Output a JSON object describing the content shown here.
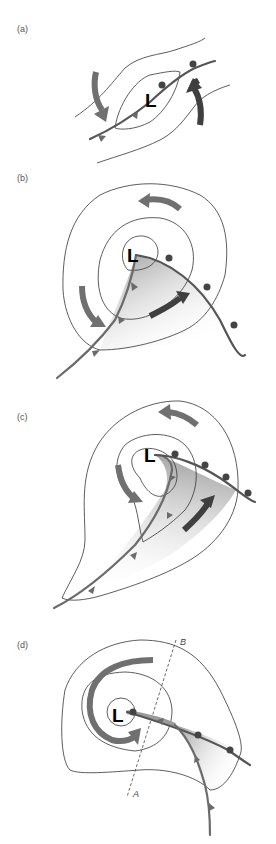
{
  "figure": {
    "panels": [
      {
        "id": "a",
        "label": "(a)",
        "low_symbol": "L",
        "description": "Stationary front with initial wave; isobars and opposing flow arrows"
      },
      {
        "id": "b",
        "label": "(b)",
        "low_symbol": "L",
        "description": "Open wave: cold front and warm front with warm sector shaded; closed isobars"
      },
      {
        "id": "c",
        "label": "(c)",
        "low_symbol": "L",
        "description": "Mature stage: cold front approaching warm front, narrowing warm sector"
      },
      {
        "id": "d",
        "label": "(d)",
        "low_symbol": "L",
        "description": "Occluded stage with occluded front; cross-section line A–B",
        "cross_section": {
          "start_label": "A",
          "end_label": "B"
        }
      }
    ],
    "legend_symbols": {
      "cold_front": "triangles",
      "warm_front": "semicircles",
      "isobars": "thin black lines",
      "flow": "thick grey arrows",
      "warm_sector": "grey gradient shading"
    },
    "colors": {
      "isobar": "#333333",
      "front": "#555555",
      "flow_arrow": "#707070",
      "flow_arrow_dark": "#3f3f3f",
      "warm_sector": "#b0b0b0"
    }
  }
}
